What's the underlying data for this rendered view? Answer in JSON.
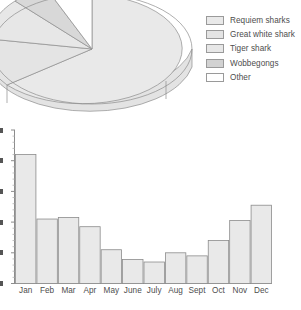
{
  "figure": {
    "background_color": "#ffffff",
    "line_color": "#8c8c8c",
    "text_color": "#4d4d4d"
  },
  "legend": {
    "position": "right-of-pie",
    "items": [
      {
        "label": "Requiem sharks",
        "color": "#e9e9e9",
        "swatch_name": "legend-swatch-requiem-sharks"
      },
      {
        "label": "Great white shark",
        "color": "#e4e4e4",
        "swatch_name": "legend-swatch-great-white-shark"
      },
      {
        "label": "Tiger shark",
        "color": "#e7e7e7",
        "swatch_name": "legend-swatch-tiger-shark"
      },
      {
        "label": "Wobbegongs",
        "color": "#d2d2d2",
        "swatch_name": "legend-swatch-wobbegongs"
      },
      {
        "label": "Other",
        "color": "#ffffff",
        "swatch_name": "legend-swatch-other"
      }
    ]
  },
  "chart_data": [
    {
      "type": "pie",
      "title": "",
      "subtitle": "",
      "xlabel": "",
      "ylabel": "",
      "three_d": true,
      "cropped": true,
      "legend_position": "right",
      "labels": [
        "Requiem sharks",
        "Great white shark",
        "Tiger shark",
        "Wobbegongs",
        "Other"
      ],
      "values": [
        47,
        21,
        15,
        7,
        10
      ],
      "colors": [
        "#e9e9e9",
        "#e4e4e4",
        "#e7e7e7",
        "#d2d2d2",
        "#ffffff"
      ],
      "annotations": [
        "Pie is cropped by the figure edge at the top and the left side."
      ]
    },
    {
      "type": "bar",
      "title": "",
      "subtitle": "",
      "xlabel": "",
      "ylabel": "",
      "grid": false,
      "legend_position": "none",
      "categories": [
        "Jan",
        "Feb",
        "Mar",
        "Apr",
        "May",
        "June",
        "July",
        "Aug",
        "Sept",
        "Oct",
        "Nov",
        "Dec"
      ],
      "values": [
        4.2,
        2.1,
        2.15,
        1.85,
        1.1,
        0.78,
        0.7,
        1.0,
        0.9,
        1.4,
        2.05,
        2.55
      ],
      "ylim": [
        0,
        5
      ],
      "yticks": [
        0,
        1,
        2,
        3,
        4,
        5
      ],
      "ytick_labels_visible": false,
      "bar_color": "#e9e9e9",
      "bar_edge_color": "#8c8c8c",
      "annotations": [
        "Y-axis tick labels are cut off by the left edge of the crop."
      ]
    }
  ]
}
